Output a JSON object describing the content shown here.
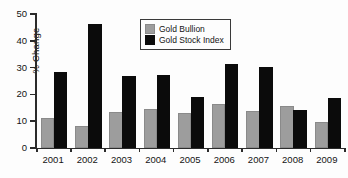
{
  "chart_data": {
    "type": "bar",
    "title": "",
    "xlabel": "",
    "ylabel": "% Change",
    "ylim": [
      0,
      50
    ],
    "yticks": [
      0,
      10,
      20,
      30,
      40,
      50
    ],
    "ytick_labels": [
      "0",
      "10",
      "20",
      "30",
      "40",
      "50"
    ],
    "grid": false,
    "legend_position": "upper-center",
    "categories": [
      "2001",
      "2002",
      "2003",
      "2004",
      "2005",
      "2006",
      "2007",
      "2008",
      "2009"
    ],
    "series": [
      {
        "name": "Gold Bullion",
        "color": "#9d9d9d",
        "values": [
          10.5,
          7.5,
          12.8,
          13.8,
          12.4,
          15.8,
          13.0,
          14.8,
          8.8
        ]
      },
      {
        "name": "Gold Stock Index",
        "color": "#0b0b0b",
        "values": [
          27.5,
          45.5,
          26.0,
          26.5,
          18.2,
          30.6,
          29.5,
          13.3,
          17.8
        ]
      }
    ]
  },
  "legend": {
    "items": [
      {
        "label": "Gold Bullion",
        "color": "#9d9d9d"
      },
      {
        "label": "Gold Stock Index",
        "color": "#0b0b0b"
      }
    ]
  },
  "axes": {
    "y_title": "% Change"
  }
}
